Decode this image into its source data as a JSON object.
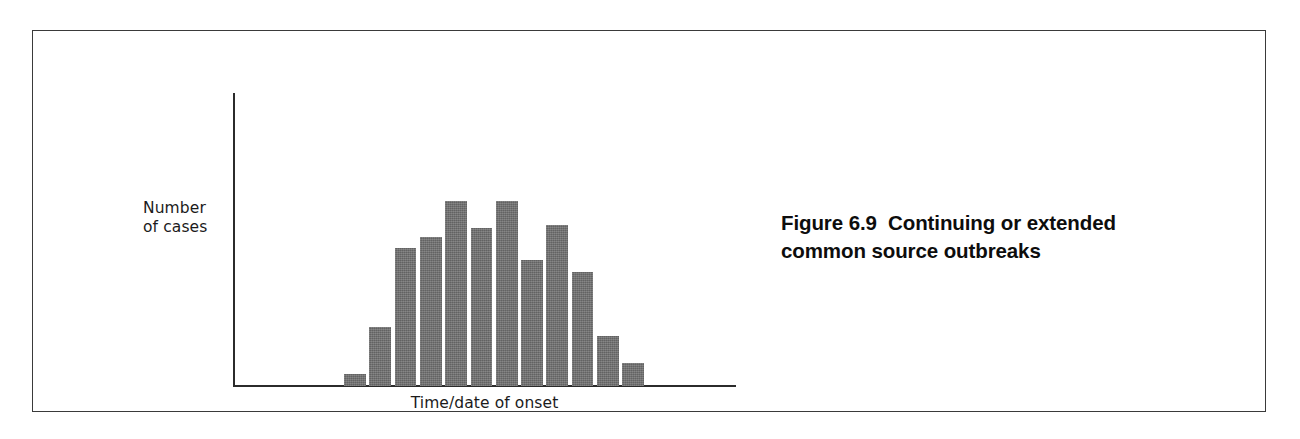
{
  "figure": {
    "caption_lines": [
      "Figure 6.9  Continuing or extended",
      "common source outbreaks"
    ],
    "caption_full": "Figure 6.9  Continuing or extended common source outbreaks",
    "number": "6.9",
    "frame_color": "#3a3a3a",
    "background_color": "#ffffff"
  },
  "chart_data": {
    "type": "bar",
    "title": "",
    "subtitle": "",
    "xlabel": "Time/date of onset",
    "ylabel": "Number\nof cases",
    "ylabel_lines": [
      "Number",
      "of cases"
    ],
    "categories": [
      "1",
      "2",
      "3",
      "4",
      "5",
      "6",
      "7",
      "8",
      "9",
      "10",
      "11",
      "12"
    ],
    "values": [
      4,
      20,
      47,
      51,
      63,
      54,
      63,
      43,
      55,
      39,
      17,
      8
    ],
    "ylim": [
      0,
      100
    ],
    "grid": false,
    "legend": null,
    "axis_ticks_shown": false,
    "bar_color": "#6e6e6e",
    "axis_color": "#2b2b2b"
  }
}
